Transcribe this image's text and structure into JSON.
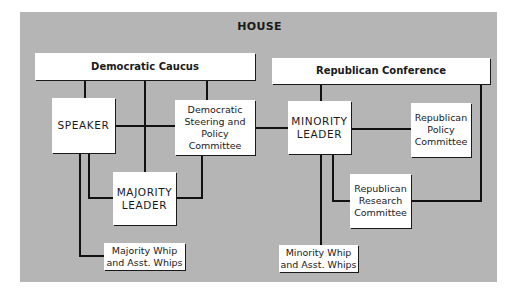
{
  "diagram": {
    "title": "HOUSE",
    "nodes": {
      "democratic_caucus": "Democratic Caucus",
      "republican_conference": "Republican Conference",
      "speaker": "SPEAKER",
      "dem_steering": "Democratic\nSteering and\nPolicy\nCommittee",
      "majority_leader": "MAJORITY\nLEADER",
      "majority_whip": "Majority Whip\nand Asst. Whips",
      "minority_leader": "MINORITY\nLEADER",
      "rep_policy": "Republican\nPolicy\nCommittee",
      "rep_research": "Republican\nResearch\nCommittee",
      "minority_whip": "Minority Whip\nand Asst. Whips"
    },
    "edges": [
      [
        "democratic_caucus",
        "speaker"
      ],
      [
        "democratic_caucus",
        "majority_leader"
      ],
      [
        "democratic_caucus",
        "dem_steering"
      ],
      [
        "speaker",
        "dem_steering"
      ],
      [
        "speaker",
        "majority_leader"
      ],
      [
        "speaker",
        "majority_whip"
      ],
      [
        "dem_steering",
        "majority_leader"
      ],
      [
        "dem_steering",
        "minority_leader"
      ],
      [
        "republican_conference",
        "minority_leader"
      ],
      [
        "republican_conference",
        "rep_research"
      ],
      [
        "minority_leader",
        "rep_policy"
      ],
      [
        "minority_leader",
        "rep_research"
      ],
      [
        "minority_leader",
        "minority_whip"
      ]
    ],
    "colors": {
      "background": "#b5b5b5",
      "box": "#ffffff",
      "line": "#111111"
    }
  }
}
